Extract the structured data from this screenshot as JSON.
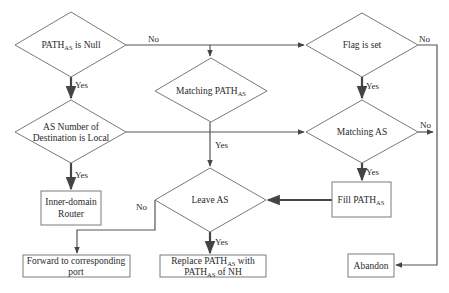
{
  "diagram": {
    "type": "flowchart",
    "decisions": {
      "path_null": {
        "main": "PATH",
        "sub": "AS",
        "rest": " is Null"
      },
      "flag_set": {
        "text": "Flag is set"
      },
      "matching_path": {
        "main": "Matching PATH",
        "sub": "AS"
      },
      "as_local": {
        "line1": "AS Number of",
        "line2": "Destination is Local"
      },
      "matching_as": {
        "text": "Matching AS"
      },
      "leave_as": {
        "text": "Leave AS"
      }
    },
    "processes": {
      "inner_router": {
        "line1": "Inner-domain",
        "line2": "Router"
      },
      "fill_path": {
        "main": "Fill PATH",
        "sub": "AS"
      },
      "forward_port": {
        "line1": "Forward to corresponding",
        "line2": "port"
      },
      "replace_path": {
        "l1a": "Replace PATH",
        "l1sub": "AS",
        "l1b": " with",
        "l2a": "PATH",
        "l2sub": "AS",
        "l2b": " of NH"
      },
      "abandon": {
        "text": "Abandon"
      }
    },
    "edge_labels": {
      "path_null_no": "No",
      "path_null_yes": "Yes",
      "flag_no": "No",
      "flag_yes": "Yes",
      "matching_path_yes": "Yes",
      "as_local_yes": "Yes",
      "matching_as_no": "No",
      "matching_as_yes": "Yes",
      "leave_as_no": "No",
      "leave_as_yes": "Yes"
    }
  }
}
